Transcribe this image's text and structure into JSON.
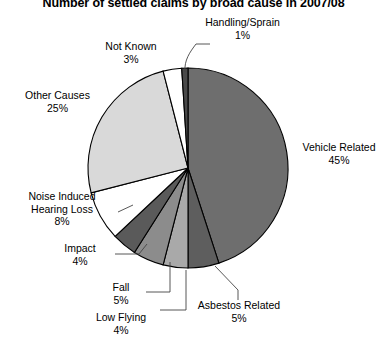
{
  "chart_data": {
    "type": "pie",
    "title": "Number of settled claims by broad cause in 2007/08",
    "xlabel": "",
    "ylabel": "",
    "legend": "none",
    "grid": false,
    "start_angle_deg": 0,
    "direction": "clockwise",
    "categories": [
      "Vehicle Related",
      "Asbestos Related",
      "Low Flying",
      "Fall",
      "Impact",
      "Noise Induced Hearing Loss",
      "Other Causes",
      "Not Known",
      "Handling/Sprain"
    ],
    "values": [
      45,
      5,
      4,
      5,
      4,
      8,
      25,
      3,
      1
    ],
    "value_labels": [
      "45%",
      "5%",
      "4%",
      "5%",
      "4%",
      "8%",
      "25%",
      "3%",
      "1%"
    ],
    "unit": "%",
    "colors": [
      "#6e6e6e",
      "#5e5e5e",
      "#a9a9a9",
      "#8c8c8c",
      "#5a5a5a",
      "#ffffff",
      "#d9d9d9",
      "#ffffff",
      "#4a4a4a"
    ],
    "slices": [
      {
        "label": "Vehicle Related",
        "value": 45,
        "value_label": "45%",
        "color": "#6e6e6e"
      },
      {
        "label": "Asbestos Related",
        "value": 5,
        "value_label": "5%",
        "color": "#5e5e5e"
      },
      {
        "label": "Low Flying",
        "value": 4,
        "value_label": "4%",
        "color": "#a9a9a9"
      },
      {
        "label": "Fall",
        "value": 5,
        "value_label": "5%",
        "color": "#8c8c8c"
      },
      {
        "label": "Impact",
        "value": 4,
        "value_label": "4%",
        "color": "#5a5a5a"
      },
      {
        "label": "Noise Induced Hearing Loss",
        "value": 8,
        "value_label": "8%",
        "color": "#ffffff"
      },
      {
        "label": "Other Causes",
        "value": 25,
        "value_label": "25%",
        "color": "#d9d9d9"
      },
      {
        "label": "Not Known",
        "value": 3,
        "value_label": "3%",
        "color": "#ffffff"
      },
      {
        "label": "Handling/Sprain",
        "value": 1,
        "value_label": "1%",
        "color": "#4a4a4a"
      }
    ]
  },
  "labels": {
    "handling_sprain": {
      "name": "Handling/Sprain",
      "value": "1%"
    },
    "not_known": {
      "name": "Not Known",
      "value": "3%"
    },
    "other_causes": {
      "name": "Other Causes",
      "value": "25%"
    },
    "noise_induced": {
      "name_line1": "Noise Induced",
      "name_line2": "Hearing Loss",
      "value": "8%"
    },
    "impact": {
      "name": "Impact",
      "value": "4%"
    },
    "fall": {
      "name": "Fall",
      "value": "5%"
    },
    "low_flying": {
      "name": "Low Flying",
      "value": "4%"
    },
    "asbestos_related": {
      "name": "Asbestos Related",
      "value": "5%"
    },
    "vehicle_related": {
      "name": "Vehicle Related",
      "value": "45%"
    }
  },
  "style": {
    "outline_color": "#000000",
    "background": "#ffffff"
  }
}
